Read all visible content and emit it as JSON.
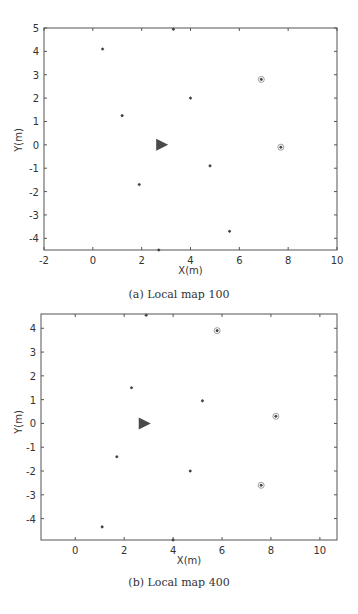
{
  "figure": {
    "panels": [
      {
        "caption": "(a)  Local map 100",
        "xlabel": "X(m)",
        "ylabel": "Y(m)",
        "xticks": [
          "-2",
          "0",
          "2",
          "4",
          "6",
          "8",
          "10"
        ],
        "yticks": [
          "5",
          "4",
          "3",
          "2",
          "1",
          "0",
          "-1",
          "-2",
          "-3",
          "-4"
        ]
      },
      {
        "caption": "(b)  Local map 400",
        "xlabel": "X(m)",
        "ylabel": "Y(m)",
        "xticks": [
          "0",
          "2",
          "4",
          "6",
          "8",
          "10"
        ],
        "yticks": [
          "4",
          "3",
          "2",
          "1",
          "0",
          "-1",
          "-2",
          "-3",
          "-4"
        ]
      }
    ]
  },
  "colors": {
    "axis": "#555555",
    "landmark": "#444444",
    "robot": "#4a4a4a",
    "circle": "#777777"
  },
  "chart_data": [
    {
      "type": "scatter",
      "title": "(a) Local map 100",
      "xlabel": "X(m)",
      "ylabel": "Y(m)",
      "xlim": [
        -2,
        10
      ],
      "ylim": [
        -4.5,
        5
      ],
      "xticks": [
        -2,
        0,
        2,
        4,
        6,
        8,
        10
      ],
      "yticks": [
        -4,
        -3,
        -2,
        -1,
        0,
        1,
        2,
        3,
        4,
        5
      ],
      "grid": false,
      "series": [
        {
          "name": "landmarks",
          "marker": "*",
          "points": [
            {
              "x": 0.4,
              "y": 4.1,
              "circled": false
            },
            {
              "x": 1.2,
              "y": 1.25,
              "circled": false
            },
            {
              "x": 4.0,
              "y": 2.0,
              "circled": false
            },
            {
              "x": 6.9,
              "y": 2.8,
              "circled": true
            },
            {
              "x": 7.7,
              "y": -0.1,
              "circled": true
            },
            {
              "x": 4.8,
              "y": -0.9,
              "circled": false
            },
            {
              "x": 1.9,
              "y": -1.7,
              "circled": false
            },
            {
              "x": 5.6,
              "y": -3.7,
              "circled": false
            },
            {
              "x": 3.3,
              "y": 4.95,
              "circled": false
            },
            {
              "x": 2.7,
              "y": -4.5,
              "circled": false
            }
          ]
        },
        {
          "name": "robot",
          "marker": "triangle-right",
          "points": [
            {
              "x": 2.8,
              "y": 0.0
            }
          ]
        }
      ]
    },
    {
      "type": "scatter",
      "title": "(b) Local map 400",
      "xlabel": "X(m)",
      "ylabel": "Y(m)",
      "xlim": [
        -1.4,
        10.7
      ],
      "ylim": [
        -4.9,
        4.6
      ],
      "xticks": [
        0,
        2,
        4,
        6,
        8,
        10
      ],
      "yticks": [
        -4,
        -3,
        -2,
        -1,
        0,
        1,
        2,
        3,
        4
      ],
      "grid": false,
      "series": [
        {
          "name": "landmarks",
          "marker": "*",
          "points": [
            {
              "x": 2.3,
              "y": 1.5,
              "circled": false
            },
            {
              "x": 5.8,
              "y": 3.9,
              "circled": true
            },
            {
              "x": 5.2,
              "y": 0.95,
              "circled": false
            },
            {
              "x": 8.2,
              "y": 0.3,
              "circled": true
            },
            {
              "x": 1.7,
              "y": -1.4,
              "circled": false
            },
            {
              "x": 4.7,
              "y": -2.0,
              "circled": false
            },
            {
              "x": 7.6,
              "y": -2.6,
              "circled": true
            },
            {
              "x": 1.1,
              "y": -4.35,
              "circled": false
            },
            {
              "x": 4.0,
              "y": -4.9,
              "circled": false
            },
            {
              "x": 2.9,
              "y": 4.55,
              "circled": false
            }
          ]
        },
        {
          "name": "robot",
          "marker": "triangle-right",
          "points": [
            {
              "x": 2.8,
              "y": 0.0
            }
          ]
        }
      ]
    }
  ]
}
